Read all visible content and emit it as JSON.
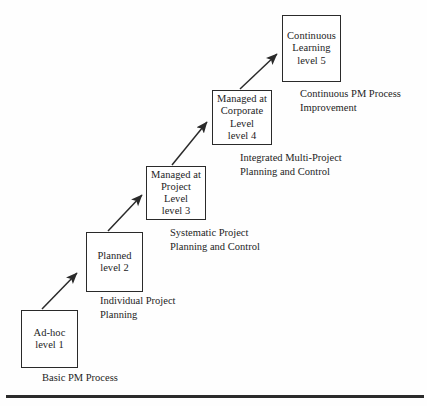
{
  "diagram": {
    "type": "staircase-maturity-model",
    "ink_color": "#2a2a2a",
    "background_color": "#fefefe",
    "stages": [
      {
        "id": "level-1",
        "box_lines": [
          "Ad-hoc",
          "level 1"
        ],
        "caption_lines": [
          "Basic PM Process"
        ],
        "box": {
          "x": 21,
          "y": 310,
          "w": 57,
          "h": 58
        },
        "caption": {
          "x": 42,
          "y": 371
        }
      },
      {
        "id": "level-2",
        "box_lines": [
          "Planned",
          "level 2"
        ],
        "caption_lines": [
          "Individual Project",
          "Planning"
        ],
        "box": {
          "x": 86,
          "y": 232,
          "w": 57,
          "h": 60
        },
        "caption": {
          "x": 100,
          "y": 294
        }
      },
      {
        "id": "level-3",
        "box_lines": [
          "Managed at",
          "Project",
          "Level",
          "level 3"
        ],
        "caption_lines": [
          "Systematic Project",
          "Planning and Control"
        ],
        "box": {
          "x": 146,
          "y": 166,
          "w": 60,
          "h": 54
        },
        "caption": {
          "x": 170,
          "y": 226
        }
      },
      {
        "id": "level-4",
        "box_lines": [
          "Managed at",
          "Corporate",
          "Level",
          "level 4"
        ],
        "caption_lines": [
          "Integrated Multi-Project",
          "Planning and Control"
        ],
        "box": {
          "x": 212,
          "y": 90,
          "w": 60,
          "h": 55
        },
        "caption": {
          "x": 240,
          "y": 151
        }
      },
      {
        "id": "level-5",
        "box_lines": [
          "Continuous",
          "Learning",
          "level 5"
        ],
        "caption_lines": [
          "Continuous PM Process",
          "Improvement"
        ],
        "box": {
          "x": 282,
          "y": 15,
          "w": 59,
          "h": 67
        },
        "caption": {
          "x": 300,
          "y": 87
        }
      }
    ],
    "arrows": [
      {
        "id": "arrow-1-to-2",
        "x1": 42,
        "y1": 309,
        "x2": 78,
        "y2": 272
      },
      {
        "id": "arrow-2-to-3",
        "x1": 108,
        "y1": 231,
        "x2": 143,
        "y2": 194
      },
      {
        "id": "arrow-3-to-4",
        "x1": 172,
        "y1": 165,
        "x2": 208,
        "y2": 121
      },
      {
        "id": "arrow-4-to-5",
        "x1": 240,
        "y1": 89,
        "x2": 278,
        "y2": 53
      }
    ],
    "baseline": {
      "x": 6,
      "y": 395,
      "w": 418,
      "h": 3
    }
  }
}
